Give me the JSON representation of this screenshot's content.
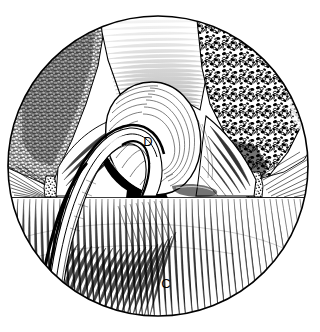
{
  "figure": {
    "kind": "anatomical-line-drawing",
    "view_shape": "circle",
    "background_color": "#ffffff",
    "ink_color": "#000000",
    "width": 320,
    "height": 332,
    "circle": {
      "cx": 158,
      "cy": 166,
      "r": 150
    }
  },
  "labels": [
    {
      "id": "label-d",
      "text": "D",
      "x": 148,
      "y": 146
    },
    {
      "id": "label-c",
      "text": "C",
      "x": 166,
      "y": 288
    }
  ],
  "regions": {
    "upper_left_bone": {
      "name": "dense-trabecular-texture",
      "texture": "fine-dark-stipple",
      "tone": "dark"
    },
    "upper_right_bone": {
      "name": "open-cellular-texture",
      "texture": "coarse-vacuolated-stipple",
      "tone": "medium-dark"
    },
    "upper_middle": {
      "name": "horizontal-hatched-wall",
      "texture": "horizontal-line-hatching",
      "tone": "light-to-medium"
    },
    "central_bulge": {
      "name": "ovoid-bulge-D",
      "texture": "concentric-contour-lines",
      "tone": "light"
    },
    "lower_field": {
      "name": "lower-hatched-field-C",
      "texture": "fine-vertical-hatching",
      "tone": "light"
    },
    "instrument": {
      "name": "curved-tubular-instrument",
      "texture": "parallel-outline-strokes",
      "tone": "outline"
    },
    "left_nodule": {
      "name": "left-stippled-nodule",
      "x": 52,
      "y": 188
    },
    "right_nodule": {
      "name": "right-stippled-nodule",
      "x": 254,
      "y": 186
    }
  },
  "divider": {
    "name": "horizontal-floor-line",
    "y": 198,
    "x_start": 12,
    "x_end": 306
  }
}
